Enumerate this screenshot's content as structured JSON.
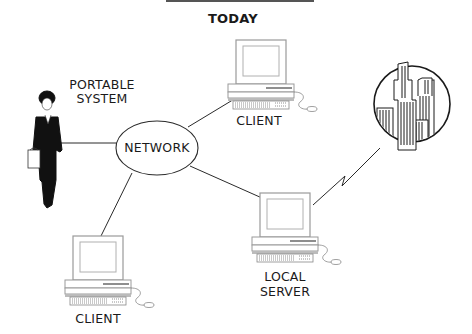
{
  "diagram": {
    "title": "TODAY",
    "center_node": {
      "label": "NETWORK"
    },
    "nodes": [
      {
        "id": "portable",
        "label_line1": "PORTABLE",
        "label_line2": "SYSTEM",
        "icon": "businesswoman-icon"
      },
      {
        "id": "client_top",
        "label": "CLIENT",
        "icon": "desktop-computer-icon"
      },
      {
        "id": "local_server",
        "label_line1": "LOCAL",
        "label_line2": "SERVER",
        "icon": "desktop-computer-icon"
      },
      {
        "id": "client_bottom",
        "label": "CLIENT",
        "icon": "desktop-computer-icon"
      },
      {
        "id": "remote_city",
        "label": "",
        "icon": "city-skyline-icon"
      }
    ],
    "connections": [
      {
        "from": "portable",
        "to": "network",
        "type": "line"
      },
      {
        "from": "network",
        "to": "client_top",
        "type": "line"
      },
      {
        "from": "network",
        "to": "local_server",
        "type": "line"
      },
      {
        "from": "network",
        "to": "client_bottom",
        "type": "line"
      },
      {
        "from": "local_server",
        "to": "remote_city",
        "type": "lightning-link"
      }
    ],
    "colors": {
      "ink": "#1a1a1a",
      "background": "#ffffff",
      "screen_frame": "#9a9a9a"
    }
  }
}
